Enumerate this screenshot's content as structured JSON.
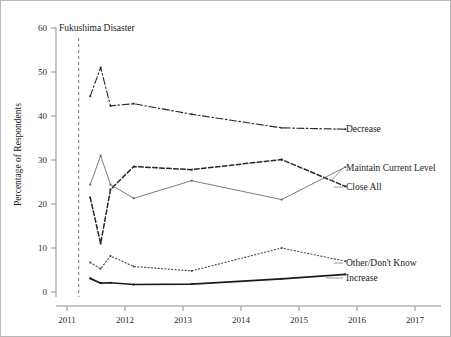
{
  "figure": {
    "background_color": "#ffffff",
    "border_color": "#b9b9b9"
  },
  "axes": {
    "ylabel": "Percentage of Respondents",
    "xlabel": "",
    "y_ticks": [
      "0",
      "10",
      "20",
      "30",
      "40",
      "50",
      "60"
    ],
    "x_ticks": [
      "2011",
      "2012",
      "2013",
      "2014",
      "2015",
      "2016",
      "2017"
    ]
  },
  "annotation": {
    "event_label": "Fukushima Disaster",
    "event_x": 2011.2
  },
  "series_labels": {
    "decrease": "Decrease",
    "maintain": "Maintain Current Level",
    "close_all": "Close All",
    "other": "Other/Don't Know",
    "increase": "Increase"
  },
  "chart_data": {
    "type": "line",
    "title": "",
    "xlabel": "",
    "ylabel": "Percentage of Respondents",
    "xlim": [
      2010.7,
      2017.4
    ],
    "ylim": [
      0,
      62
    ],
    "grid": false,
    "legend_position": "right-inline-labels",
    "y_ticks": [
      0,
      10,
      20,
      30,
      40,
      50,
      60
    ],
    "x_ticks": [
      2011,
      2012,
      2013,
      2014,
      2015,
      2016,
      2017
    ],
    "annotations": [
      {
        "text": "Fukushima Disaster",
        "type": "vertical-dashed-line",
        "x": 2011.2,
        "color": "#8d8d8d"
      }
    ],
    "series": [
      {
        "name": "Decrease",
        "style": "dash-dot",
        "color": "#262626",
        "x": [
          2011.4,
          2011.58,
          2011.75,
          2012.15,
          2013.15,
          2014.7,
          2015.8
        ],
        "values": [
          44.5,
          51.0,
          42.3,
          42.8,
          40.4,
          37.3,
          37.0
        ]
      },
      {
        "name": "Close All",
        "style": "dashed",
        "color": "#262626",
        "x": [
          2011.4,
          2011.58,
          2011.75,
          2012.15,
          2013.15,
          2014.7,
          2015.8
        ],
        "values": [
          21.5,
          11.0,
          23.3,
          28.5,
          27.8,
          30.1,
          24.0
        ]
      },
      {
        "name": "Maintain Current Level",
        "style": "solid-thin",
        "color": "#5b5b5b",
        "x": [
          2011.4,
          2011.58,
          2011.75,
          2012.15,
          2013.15,
          2014.7,
          2015.8
        ],
        "values": [
          24.4,
          31.0,
          24.4,
          21.3,
          25.3,
          21.0,
          28.4
        ]
      },
      {
        "name": "Other/Don't Know",
        "style": "dotted",
        "color": "#4a4a4a",
        "x": [
          2011.4,
          2011.58,
          2011.75,
          2012.15,
          2013.15,
          2014.7,
          2015.8
        ],
        "values": [
          6.7,
          5.3,
          8.2,
          5.8,
          4.8,
          10.0,
          7.0
        ]
      },
      {
        "name": "Increase",
        "style": "solid-thick",
        "color": "#1a1a1a",
        "x": [
          2011.4,
          2011.58,
          2011.75,
          2012.15,
          2013.15,
          2014.7,
          2015.8
        ],
        "values": [
          3.1,
          2.0,
          2.1,
          1.7,
          1.8,
          3.0,
          4.0
        ]
      }
    ]
  }
}
